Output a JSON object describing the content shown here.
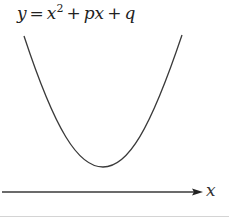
{
  "diagram": {
    "equation": {
      "lhs": "y",
      "eq": "=",
      "term1_base": "x",
      "term1_exp": "2",
      "plus1": "+",
      "term2": "px",
      "plus2": "+",
      "term3": "q"
    },
    "axis": {
      "label": "x"
    },
    "colors": {
      "curve": "#3a3a3a",
      "axis": "#3a3a3a",
      "text": "#222222",
      "rule": "#d4d4d4"
    }
  }
}
